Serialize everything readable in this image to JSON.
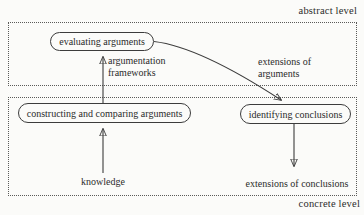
{
  "diagram": {
    "levels": {
      "abstract": "abstract level",
      "concrete": "concrete level"
    },
    "nodes": {
      "evaluating_arguments": "evaluating arguments",
      "constructing_comparing_arguments": "constructing and comparing arguments",
      "identifying_conclusions": "identifying conclusions"
    },
    "edge_labels": {
      "argumentation_frameworks": {
        "line1": "argumentation",
        "line2": "frameworks"
      },
      "extensions_of_arguments": {
        "line1": "extensions of",
        "line2": "arguments"
      },
      "knowledge": "knowledge",
      "extensions_of_conclusions": "extensions of conclusions"
    },
    "colors": {
      "ink": "#2b2b2b",
      "line": "#3c3c3c",
      "background": "#fbfbf9"
    }
  }
}
